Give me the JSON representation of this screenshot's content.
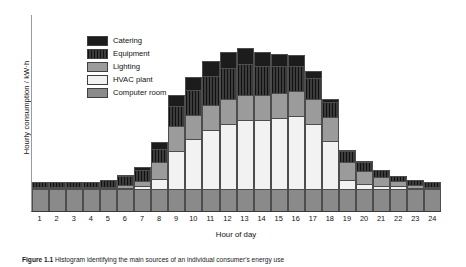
{
  "figure": {
    "caption_prefix": "Figure 1.1",
    "caption_text": "Histogram identifying the main sources of an individual consumer's energy use"
  },
  "axes": {
    "ylabel": "Hourly consumption / kW·h",
    "xlabel": "Hour of day",
    "xticks": [
      "1",
      "2",
      "3",
      "4",
      "5",
      "6",
      "7",
      "8",
      "9",
      "10",
      "11",
      "12",
      "13",
      "14",
      "15",
      "16",
      "17",
      "18",
      "19",
      "20",
      "21",
      "22",
      "23",
      "24"
    ],
    "yticks": []
  },
  "legend": {
    "position": "upper-left-inside",
    "items": [
      {
        "label": "Catering",
        "swatch": "black-solid",
        "color": "#1c1c1c"
      },
      {
        "label": "Equipment",
        "swatch": "dark-vertical-hatch",
        "color": "#262626"
      },
      {
        "label": "Lighting",
        "swatch": "mid-gray",
        "color": "#9b9b9b"
      },
      {
        "label": "HVAC plant",
        "swatch": "white",
        "color": "#f2f2f2"
      },
      {
        "label": "Computer room",
        "swatch": "gray",
        "color": "#8a8a8a"
      }
    ]
  },
  "chart_data": {
    "type": "bar",
    "subtype": "stacked-vertical",
    "title": "",
    "xlabel": "Hour of day",
    "ylabel": "Hourly consumption / kW·h",
    "grid": false,
    "ylim": [
      0,
      100
    ],
    "y_axis_labelled": false,
    "categories": [
      "1",
      "2",
      "3",
      "4",
      "5",
      "6",
      "7",
      "8",
      "9",
      "10",
      "11",
      "12",
      "13",
      "14",
      "15",
      "16",
      "17",
      "18",
      "19",
      "20",
      "21",
      "22",
      "23",
      "24"
    ],
    "stack_order_bottom_to_top": [
      "Computer room",
      "HVAC plant",
      "Lighting",
      "Equipment",
      "Catering"
    ],
    "series": [
      {
        "name": "Computer room",
        "color": "#8a8a8a",
        "values": [
          11,
          11,
          11,
          11,
          11,
          11,
          11,
          11,
          11,
          11,
          11,
          11,
          11,
          11,
          11,
          11,
          11,
          11,
          11,
          11,
          11,
          11,
          11,
          11
        ]
      },
      {
        "name": "HVAC plant",
        "color": "#f2f2f2",
        "values": [
          1,
          1,
          1,
          1,
          1,
          1,
          2,
          6,
          20,
          26,
          31,
          34,
          36,
          36,
          37,
          38,
          34,
          25,
          5,
          3,
          2,
          2,
          1,
          1
        ]
      },
      {
        "name": "Lighting",
        "color": "#9b9b9b",
        "values": [
          1,
          1,
          1,
          1,
          1,
          2,
          3,
          9,
          13,
          13,
          13,
          13,
          13,
          13,
          13,
          13,
          13,
          13,
          10,
          7,
          5,
          3,
          2,
          1
        ]
      },
      {
        "name": "Equipment",
        "color": "#262626",
        "values": [
          3,
          3,
          3,
          3,
          4,
          5,
          6,
          7,
          11,
          13,
          15,
          16,
          16,
          15,
          14,
          13,
          11,
          8,
          6,
          5,
          4,
          3,
          3,
          3
        ]
      },
      {
        "name": "Catering",
        "color": "#1c1c1c",
        "values": [
          0,
          0,
          0,
          0,
          0,
          1,
          2,
          4,
          6,
          7,
          8,
          9,
          9,
          8,
          7,
          6,
          4,
          2,
          1,
          1,
          0,
          0,
          0,
          0
        ]
      }
    ],
    "totals": [
      16,
      16,
      16,
      16,
      17,
      20,
      24,
      37,
      61,
      70,
      78,
      83,
      85,
      83,
      82,
      81,
      73,
      59,
      33,
      27,
      22,
      19,
      17,
      16
    ]
  }
}
